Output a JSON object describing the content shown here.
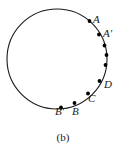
{
  "figure": {
    "caption": "(b)",
    "circle": {
      "cx": 57,
      "cy": 59,
      "r": 50,
      "stroke_color": "#1a1a1a",
      "stroke_width": 1.1,
      "fill": "none"
    },
    "point_color": "#000000",
    "point_radius": 1.9,
    "points": [
      {
        "id": "A",
        "label": "A",
        "x": 89.5,
        "y": 21.0,
        "label_x": 93,
        "label_y": 14
      },
      {
        "id": "Aprime",
        "label": "A'",
        "x": 99.0,
        "y": 34.5,
        "label_x": 103,
        "label_y": 28
      },
      {
        "id": "P1",
        "label": "",
        "x": 104.5,
        "y": 45.5,
        "label_x": 0,
        "label_y": 0
      },
      {
        "id": "P2",
        "label": "",
        "x": 106.5,
        "y": 55.0,
        "label_x": 0,
        "label_y": 0
      },
      {
        "id": "P3",
        "label": "",
        "x": 105.5,
        "y": 65.0,
        "label_x": 0,
        "label_y": 0
      },
      {
        "id": "D",
        "label": "D",
        "x": 99.5,
        "y": 81.0,
        "label_x": 104,
        "label_y": 79
      },
      {
        "id": "C",
        "label": "C",
        "x": 88.0,
        "y": 93.5,
        "label_x": 88,
        "label_y": 93
      },
      {
        "id": "B",
        "label": "B",
        "x": 74.5,
        "y": 103.0,
        "label_x": 72,
        "label_y": 106
      },
      {
        "id": "Bprime",
        "label": "B'",
        "x": 61.0,
        "y": 107.5,
        "label_x": 55,
        "label_y": 106
      }
    ]
  }
}
